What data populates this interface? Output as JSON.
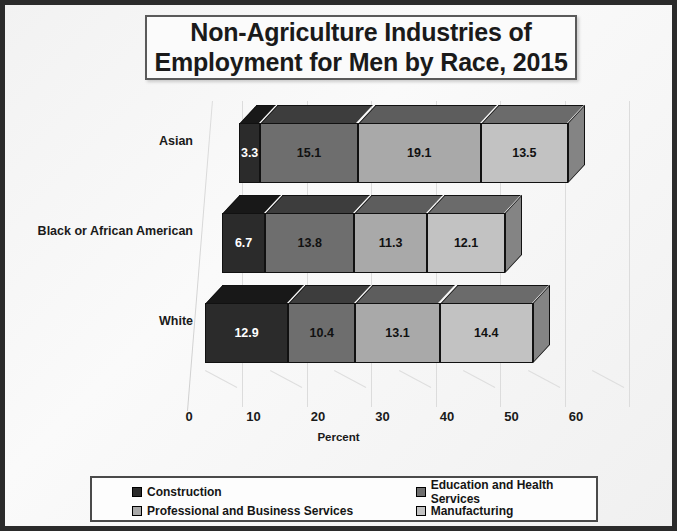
{
  "chart_data": {
    "type": "bar",
    "orientation": "horizontal",
    "stacked": true,
    "style": "3d",
    "title": "Non-Agriculture Industries of\nEmployment for Men by Race, 2015",
    "xlabel": "Percent",
    "ylabel": "",
    "xlim": [
      0,
      60
    ],
    "xticks": [
      0,
      10,
      20,
      30,
      40,
      50,
      60
    ],
    "grid": true,
    "legend_position": "bottom",
    "categories": [
      "Asian",
      "Black or African American",
      "White"
    ],
    "series": [
      {
        "name": "Construction",
        "color": "#2b2b2b",
        "values": [
          3.3,
          6.7,
          12.9
        ]
      },
      {
        "name": "Education and Health Services",
        "color": "#6e6e6e",
        "values": [
          15.1,
          13.8,
          10.4
        ]
      },
      {
        "name": "Professional and Business Services",
        "color": "#a9a9a9",
        "values": [
          19.1,
          11.3,
          13.1
        ]
      },
      {
        "name": "Manufacturing",
        "color": "#c2c2c2",
        "values": [
          13.5,
          12.1,
          14.4
        ]
      }
    ]
  },
  "title": {
    "line1": "Non-Agriculture Industries of",
    "line2": "Employment for Men by Race, 2015",
    "full": "Non-Agriculture Industries of\nEmployment for Men by Race, 2015"
  },
  "axis": {
    "x_label": "Percent",
    "x_ticks": [
      "0",
      "10",
      "20",
      "30",
      "40",
      "50",
      "60"
    ]
  },
  "categories": [
    {
      "label": "Asian",
      "values": [
        "3.3",
        "15.1",
        "19.1",
        "13.5"
      ]
    },
    {
      "label": "Black or African American",
      "values": [
        "6.7",
        "13.8",
        "11.3",
        "12.1"
      ]
    },
    {
      "label": "White",
      "values": [
        "12.9",
        "10.4",
        "13.1",
        "14.4"
      ]
    }
  ],
  "legend": {
    "items": [
      {
        "label": "Construction",
        "color": "#2b2b2b"
      },
      {
        "label": "Education and Health Services",
        "color": "#6e6e6e"
      },
      {
        "label": "Professional and Business Services",
        "color": "#a9a9a9"
      },
      {
        "label": "Manufacturing",
        "color": "#c2c2c2"
      }
    ]
  },
  "colors": {
    "construction": "#2b2b2b",
    "education_health": "#6e6e6e",
    "professional_business": "#a9a9a9",
    "manufacturing": "#c2c2c2",
    "frame": "#2b2b2b",
    "background": "#f4f4f4"
  }
}
